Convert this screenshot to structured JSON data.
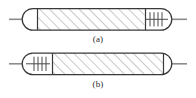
{
  "figure": {
    "title": "",
    "colors": {
      "outline": "#3a3a3a",
      "hatch": "#9a9a9a",
      "rod": "#8c8c8c",
      "coil_tick": "#4a4a4a",
      "background": "#ffffff",
      "caption_text": "#2a2a2a"
    },
    "panels": [
      {
        "id": "a",
        "caption": "(a)",
        "coil_side": "right",
        "coil_tick_count": 4,
        "rod_ends": [
          "left",
          "right"
        ],
        "hatch_pattern": "diagonal-45",
        "shape": "capsule"
      },
      {
        "id": "b",
        "caption": "(b)",
        "coil_side": "left",
        "coil_tick_count": 4,
        "rod_ends": [
          "left",
          "right"
        ],
        "hatch_pattern": "diagonal-45",
        "shape": "capsule"
      }
    ]
  }
}
